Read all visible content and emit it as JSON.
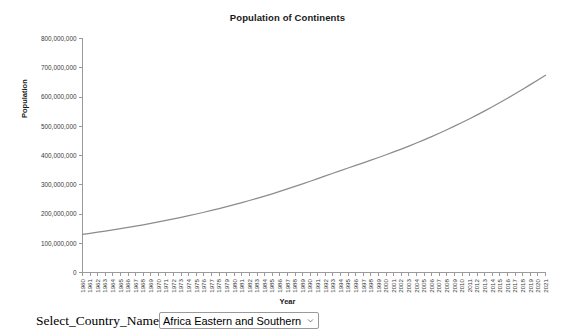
{
  "chart_data": {
    "type": "line",
    "title": "Population of Continents",
    "xlabel": "Year",
    "ylabel": "Population",
    "ylim": [
      0,
      800000000
    ],
    "y_ticks": [
      0,
      100000000,
      200000000,
      300000000,
      400000000,
      500000000,
      600000000,
      700000000,
      800000000
    ],
    "y_tick_labels": [
      "0",
      "100,000,000",
      "200,000,000",
      "300,000,000",
      "400,000,000",
      "500,000,000",
      "600,000,000",
      "700,000,000",
      "800,000,000"
    ],
    "grid": false,
    "legend": "none",
    "line_color": "#8c8c8c",
    "categories": [
      "1960",
      "1961",
      "1962",
      "1963",
      "1964",
      "1965",
      "1966",
      "1967",
      "1968",
      "1969",
      "1970",
      "1971",
      "1972",
      "1973",
      "1974",
      "1975",
      "1976",
      "1977",
      "1978",
      "1979",
      "1980",
      "1981",
      "1982",
      "1983",
      "1984",
      "1985",
      "1986",
      "1987",
      "1988",
      "1989",
      "1990",
      "1991",
      "1992",
      "1993",
      "1994",
      "1995",
      "1996",
      "1997",
      "1998",
      "1999",
      "2000",
      "2001",
      "2002",
      "2003",
      "2004",
      "2005",
      "2006",
      "2007",
      "2008",
      "2009",
      "2010",
      "2011",
      "2012",
      "2013",
      "2014",
      "2015",
      "2016",
      "2017",
      "2018",
      "2019",
      "2020",
      "2021"
    ],
    "series": [
      {
        "name": "Africa Eastern and Southern",
        "values": [
          130692579,
          134169237,
          137835590,
          141630546,
          145605995,
          149742351,
          154043279,
          158511171,
          163151304,
          167952068,
          172917595,
          178034627,
          183285168,
          188678245,
          194242217,
          200014718,
          206008867,
          212204219,
          218585672,
          225149435,
          231915808,
          238897995,
          246107458,
          253547372,
          261214139,
          269100316,
          277216173,
          285590597,
          294217919,
          303054132,
          312008314,
          321069086,
          330204310,
          339325063,
          348326571,
          357205704,
          366041822,
          374921108,
          383930464,
          393108872,
          402479714,
          412086484,
          421961622,
          432125080,
          442598852,
          453413312,
          464579436,
          476100296,
          487978880,
          500227265,
          512834776,
          525786368,
          539079588,
          552721534,
          566733420,
          581137747,
          595945473,
          611117166,
          626602172,
          642345696,
          658286563,
          674389472
        ]
      }
    ]
  },
  "controls": {
    "select_label": "Select_Country_Name",
    "selected_country": "Africa Eastern and Southern",
    "dropdown_icon": "chevron-down-icon"
  }
}
